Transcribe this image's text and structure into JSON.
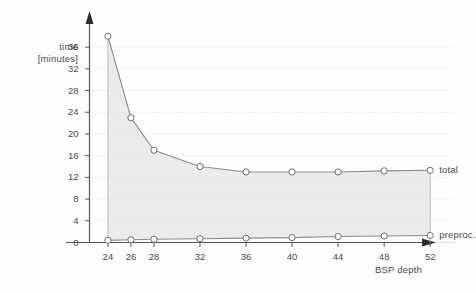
{
  "chart_data": {
    "type": "line",
    "title": "",
    "xlabel": "BSP depth",
    "ylabel": "time [minutes]",
    "ylabel_lines": [
      "time",
      "[minutes]"
    ],
    "x": [
      24,
      26,
      28,
      32,
      36,
      40,
      44,
      48,
      52
    ],
    "xticks": [
      "24",
      "26",
      "28",
      "32",
      "36",
      "40",
      "44",
      "48",
      "52"
    ],
    "yticks": [
      "0",
      "4",
      "8",
      "12",
      "16",
      "20",
      "24",
      "28",
      "32",
      "36"
    ],
    "ylim": [
      0,
      38.6
    ],
    "xlim": [
      22.4,
      53.2
    ],
    "grid": true,
    "grid_style": "dotted-horizontal",
    "legend_position": "right-inline",
    "fill_between": true,
    "series": [
      {
        "name": "total",
        "label": "total",
        "color": "#8c8c8c",
        "marker": "open-circle",
        "values": [
          38.0,
          23.0,
          17.0,
          14.0,
          13.0,
          13.0,
          13.0,
          13.2,
          13.3
        ]
      },
      {
        "name": "preproc.",
        "label": "preproc.",
        "color": "#8c8c8c",
        "marker": "open-circle",
        "values": [
          0.4,
          0.5,
          0.6,
          0.7,
          0.8,
          0.9,
          1.1,
          1.2,
          1.3
        ]
      }
    ],
    "colors": {
      "line": "#8c8c8c",
      "marker_stroke": "#6e6e6e",
      "marker_fill": "#ffffff",
      "fill_area": "#e8e8e8",
      "axis": "#555555",
      "gridline": "#d8d8d8",
      "text": "#4a4a4a",
      "background": "#fefefe"
    }
  }
}
